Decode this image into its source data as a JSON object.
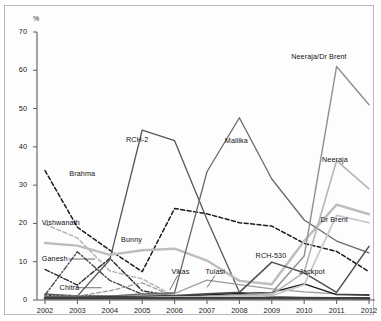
{
  "figure": {
    "unit_label": "%",
    "background": "#ffffff",
    "frame_color": "#b9b9b9"
  },
  "chart_data": {
    "type": "line",
    "title": "",
    "xlabel": "",
    "ylabel": "%",
    "grid": false,
    "legend": "inline-annotations",
    "xlim": [
      2002,
      2012
    ],
    "ylim": [
      0,
      70
    ],
    "yticks": [
      0,
      10,
      20,
      30,
      40,
      50,
      60,
      70
    ],
    "categories": [
      "2002",
      "2003",
      "2004",
      "2005",
      "2006",
      "2007",
      "2008",
      "2009",
      "2010",
      "2011",
      "2012"
    ],
    "series": [
      {
        "name": "Brahma",
        "color": "#1a1a1a",
        "dash": "4,2.5",
        "width": 1.5,
        "label_x": 2002.75,
        "label_y": 33.0,
        "values": [
          33.8,
          19.0,
          13.0,
          7.4,
          23.9,
          22.5,
          20.2,
          19.3,
          14.8,
          12.7,
          7.4
        ]
      },
      {
        "name": "Vishwanath",
        "color": "#b0b0b0",
        "dash": "4,2.5",
        "width": 1.4,
        "label_x": 2001.9,
        "label_y": 20.1,
        "values": [
          19.8,
          16.2,
          7.6,
          5.5,
          1.0,
          0.9,
          0.8,
          0.7,
          0.6,
          0.6,
          0.5
        ]
      },
      {
        "name": "Ganesh",
        "color": "#2b2b2b",
        "dash": "5,2,1.5,2",
        "width": 1.4,
        "label_x": 2001.9,
        "label_y": 10.6,
        "values": [
          8.0,
          3.9,
          10.9,
          2.4,
          1.0,
          0.8,
          0.7,
          0.6,
          0.5,
          0.5,
          0.4
        ]
      },
      {
        "name": "Chitra",
        "color": "#3a3a3a",
        "dash": "2,2",
        "width": 1.6,
        "label_x": 2002.45,
        "label_y": 3.2,
        "values": [
          1.3,
          1.1,
          1.1,
          1.0,
          0.9,
          0.8,
          0.7,
          0.6,
          0.5,
          0.5,
          0.4
        ]
      },
      {
        "name": "Ganesh-dash",
        "color": "#4a4a4a",
        "dash": "5,2,1.5,2",
        "width": 1.4,
        "label_x": null,
        "label_y": null,
        "values": [
          1.3,
          12.6,
          5.1,
          1.5,
          1.0,
          0.8,
          0.7,
          0.6,
          0.5,
          0.4,
          0.4
        ]
      },
      {
        "name": "RCH-2",
        "color": "#565656",
        "dash": "none",
        "width": 1.3,
        "label_x": 2004.5,
        "label_y": 41.8,
        "values": [
          1.6,
          1.0,
          10.5,
          44.4,
          41.6,
          21.0,
          2.0,
          0.9,
          0.7,
          0.6,
          0.5
        ]
      },
      {
        "name": "Bunny",
        "color": "#bdbdbd",
        "dash": "none",
        "width": 2.4,
        "label_x": 2004.35,
        "label_y": 15.7,
        "values": [
          14.9,
          14.2,
          11.8,
          13.0,
          13.4,
          10.3,
          5.0,
          4.1,
          15.4,
          24.9,
          22.4
        ]
      },
      {
        "name": "Vikas",
        "color": "#9a9a9a",
        "dash": "4,2.5",
        "width": 1.3,
        "label_x": 2005.9,
        "label_y": 7.2,
        "values": [
          1.0,
          1.0,
          2.4,
          4.5,
          0.8,
          0.7,
          0.6,
          0.6,
          0.5,
          0.5,
          0.4
        ]
      },
      {
        "name": "Tulasi",
        "color": "#9a9a9a",
        "dash": "none",
        "width": 1.3,
        "label_x": 2006.95,
        "label_y": 7.2,
        "values": [
          0.8,
          0.9,
          1.1,
          1.3,
          1.7,
          5.2,
          4.0,
          2.9,
          2.1,
          1.6,
          1.3
        ]
      },
      {
        "name": "Mallika",
        "color": "#6a6a6a",
        "dash": "none",
        "width": 1.3,
        "label_x": 2007.55,
        "label_y": 41.5,
        "values": [
          0.8,
          0.8,
          1.0,
          1.6,
          1.9,
          33.5,
          47.6,
          31.6,
          20.9,
          15.4,
          12.3
        ]
      },
      {
        "name": "RCH-530",
        "color": "#4f4f4f",
        "dash": "none",
        "width": 1.5,
        "label_x": 2008.5,
        "label_y": 11.5,
        "values": [
          0.7,
          0.7,
          0.8,
          0.9,
          1.2,
          1.6,
          2.0,
          9.9,
          7.1,
          2.0,
          14.0
        ]
      },
      {
        "name": "Jackpot",
        "color": "#1d1d1d",
        "dash": "none",
        "width": 1.4,
        "label_x": 2009.85,
        "label_y": 7.3,
        "values": [
          0.6,
          0.6,
          0.7,
          0.8,
          1.0,
          1.3,
          1.7,
          2.0,
          4.2,
          1.4,
          1.3
        ]
      },
      {
        "name": "Neeraja/Dr Brent",
        "color": "#8e8e8e",
        "dash": "none",
        "width": 1.4,
        "label_x": 2009.6,
        "label_y": 63.5,
        "values": [
          0.6,
          0.6,
          0.6,
          0.7,
          0.9,
          1.0,
          1.4,
          1.9,
          11.5,
          61.0,
          51.0
        ]
      },
      {
        "name": "Neeraja",
        "color": "#b5b5b5",
        "dash": "none",
        "width": 1.6,
        "label_x": 2010.55,
        "label_y": 36.5,
        "values": [
          0.5,
          0.5,
          0.5,
          0.6,
          0.8,
          0.9,
          1.1,
          1.4,
          7.3,
          36.4,
          29.0
        ]
      },
      {
        "name": "Dr Brent",
        "color": "#c6c6c6",
        "dash": "none",
        "width": 1.6,
        "label_x": 2010.5,
        "label_y": 20.8,
        "values": [
          0.5,
          0.5,
          0.5,
          0.5,
          0.6,
          0.7,
          0.9,
          1.1,
          4.0,
          22.1,
          20.2
        ]
      },
      {
        "name": "Baseline",
        "color": "#3f3f3f",
        "dash": "none",
        "width": 2.6,
        "label_x": null,
        "label_y": null,
        "values": [
          0.45,
          0.45,
          0.45,
          0.45,
          0.45,
          0.45,
          0.45,
          0.45,
          0.45,
          0.45,
          0.45
        ]
      }
    ]
  }
}
